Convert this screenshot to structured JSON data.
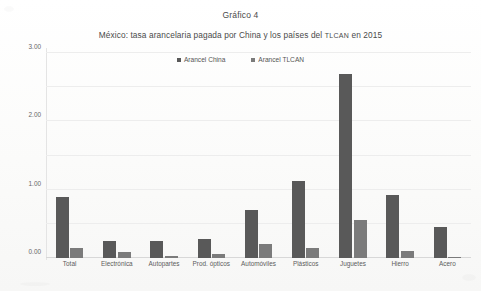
{
  "chart_data": {
    "type": "bar",
    "title": "Gráfico 4",
    "subtitle_prefix": "México: tasa arancelaria pagada por China y los países del ",
    "subtitle_smallcaps": "TLCAN",
    "subtitle_suffix": " en 2015",
    "xlabel": "",
    "ylabel": "",
    "ylim": [
      0,
      6
    ],
    "ytick_step": 1,
    "ytick_labels": [
      "0.00",
      "1.00",
      "2.00",
      "3.00",
      "4.00",
      "5.00",
      "6.00"
    ],
    "ytick_values": [
      0,
      1,
      2,
      3,
      4,
      5,
      6
    ],
    "grid": true,
    "legend_position": "top-center",
    "categories": [
      "Total",
      "Electrónica",
      "Autopartes",
      "Prod. ópticos",
      "Automóviles",
      "Plásticos",
      "Juguetes",
      "Hierro",
      "Acero"
    ],
    "series": [
      {
        "name": "Arancel China",
        "color": "#595959",
        "values": [
          1.78,
          0.5,
          0.5,
          0.55,
          1.4,
          2.25,
          5.38,
          1.85,
          0.9
        ]
      },
      {
        "name": "Arancel TLCAN",
        "color": "#7b7b7b",
        "values": [
          0.3,
          0.18,
          0.07,
          0.12,
          0.42,
          0.3,
          1.11,
          0.2,
          0.02
        ]
      }
    ]
  }
}
